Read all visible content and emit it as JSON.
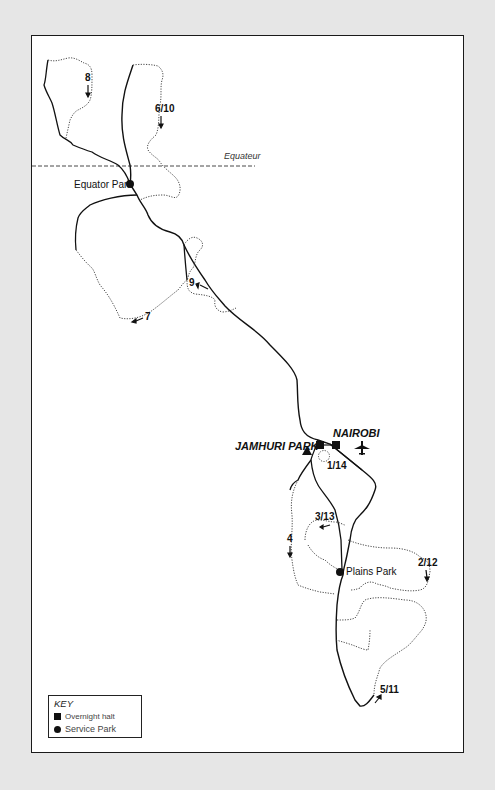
{
  "map": {
    "equator_label": "Equateur",
    "places": {
      "equator_park": "Equator Park",
      "plains_park": "Plains Park",
      "jamhuri_park": "JAMHURI PARK",
      "nairobi": "NAIROBI"
    },
    "stages": [
      {
        "id": "s8",
        "label": "8",
        "arrow": "down"
      },
      {
        "id": "s6_10",
        "label": "6/10",
        "arrow": "down"
      },
      {
        "id": "s9",
        "label": "9",
        "arrow": "left-up"
      },
      {
        "id": "s7",
        "label": "7",
        "arrow": "left"
      },
      {
        "id": "s1_14",
        "label": "1/14"
      },
      {
        "id": "s3_13",
        "label": "3/13",
        "arrow": "left"
      },
      {
        "id": "s4",
        "label": "4",
        "arrow": "down"
      },
      {
        "id": "s2_12",
        "label": "2/12",
        "arrow": "down"
      },
      {
        "id": "s5_11",
        "label": "5/11",
        "arrow": "up-right"
      }
    ],
    "icons": {
      "airport": "airplane-icon",
      "start": "triangle-icon"
    }
  },
  "key": {
    "title": "KEY",
    "items": [
      {
        "symbol": "square",
        "label": "Overnight halt"
      },
      {
        "symbol": "circle",
        "label": "Service Park"
      }
    ]
  }
}
